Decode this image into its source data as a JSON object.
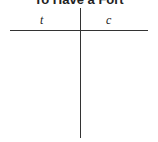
{
  "title": "To Have a Fort",
  "tchart": {
    "left_header": "t",
    "right_header": "c"
  }
}
